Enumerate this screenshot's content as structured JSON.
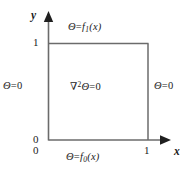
{
  "figure": {
    "type": "boundary-value-problem-diagram",
    "domain_shape": "unit square",
    "line_color": "#6b6b6b",
    "text_color": "#1a1a1a",
    "background": "#ffffff"
  },
  "axes": {
    "x": {
      "label": "x",
      "ticks": [
        "0",
        "1"
      ],
      "arrow": "right"
    },
    "y": {
      "label": "y",
      "ticks": [
        "0",
        "1"
      ],
      "arrow": "up"
    }
  },
  "labels": {
    "top": {
      "theta": "Θ",
      "equals": "=",
      "func": "f",
      "subscript": "1",
      "arg": "(x)"
    },
    "bottom": {
      "theta": "Θ",
      "equals": "=",
      "func": "f",
      "subscript": "0",
      "arg": "(x)"
    },
    "left": {
      "theta": "Θ",
      "equals": "=",
      "value": "0"
    },
    "right": {
      "theta": "Θ",
      "equals": "=",
      "value": "0"
    },
    "center": {
      "operator": "∇",
      "power": "2",
      "theta": "Θ",
      "equals": "=",
      "value": "0"
    }
  }
}
